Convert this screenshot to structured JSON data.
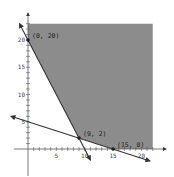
{
  "chart_data": {
    "type": "line",
    "title": "",
    "xlabel": "",
    "ylabel": "",
    "xlim": [
      0,
      22
    ],
    "ylim": [
      0,
      23
    ],
    "x_ticks": [
      5,
      10,
      15,
      20
    ],
    "y_ticks": [
      5,
      10,
      15,
      20
    ],
    "grid": false,
    "legend": null,
    "series": [
      {
        "name": "line-1",
        "equation": "y = 20 - 2x",
        "points": [
          [
            -1.5,
            23
          ],
          [
            11,
            -2
          ]
        ]
      },
      {
        "name": "line-2",
        "equation": "y = 5 - x/3",
        "points": [
          [
            -3,
            6
          ],
          [
            21.5,
            -2.2
          ]
        ]
      }
    ],
    "feasible_region": {
      "description": "shaded region above both lines",
      "vertices": [
        [
          0,
          23
        ],
        [
          0,
          20
        ],
        [
          9,
          2
        ],
        [
          15,
          0
        ],
        [
          22,
          0
        ],
        [
          22,
          23
        ]
      ],
      "color": "#8c8c8c"
    },
    "annotations": [
      {
        "label": "(0, 20)",
        "x": 0,
        "y": 20
      },
      {
        "label": "(9, 2)",
        "x": 9,
        "y": 2
      },
      {
        "label": "(15, 0)",
        "x": 15,
        "y": 0
      }
    ]
  },
  "colors": {
    "region": "#8c8c8c",
    "line": "#333333",
    "axis": "#555555",
    "tick_label": "#444444"
  }
}
